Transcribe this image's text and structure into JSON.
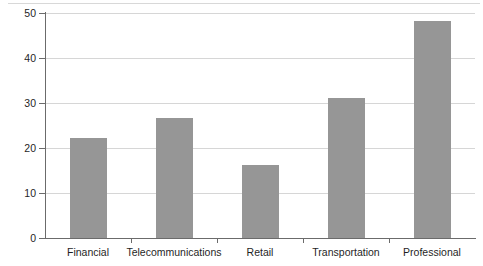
{
  "chart_data": {
    "type": "bar",
    "title": "",
    "subtitle": "",
    "xlabel": "",
    "ylabel": "",
    "categories": [
      "Financial",
      "Telecommunications",
      "Retail",
      "Transportation",
      "Professional"
    ],
    "values": [
      22.2,
      26.7,
      16.3,
      31.1,
      48.2
    ],
    "series": [
      {
        "name": "",
        "values": [
          22.2,
          26.7,
          16.3,
          31.1,
          48.2
        ]
      }
    ],
    "ylim": [
      0,
      50
    ],
    "xlim": [
      0,
      5
    ],
    "yticks": [
      0,
      10,
      20,
      30,
      40,
      50
    ],
    "ytick_labels": [
      "0",
      "10",
      "20",
      "30",
      "40",
      "50"
    ],
    "grid": "horizontal",
    "legend": "none",
    "annotations": [],
    "colors": {
      "bar_fill": "#969696",
      "gridline": "#d6d6d6",
      "axis": "#6b6b6b",
      "text": "#1f1f1f",
      "background": "#ffffff"
    }
  }
}
